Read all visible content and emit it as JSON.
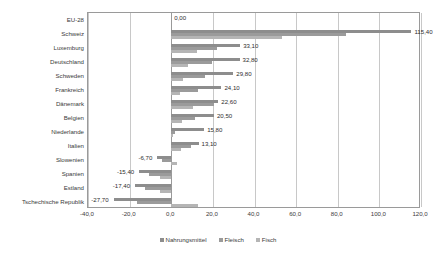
{
  "chart_data": {
    "type": "bar",
    "orientation": "horizontal",
    "title": "",
    "xlabel": "",
    "ylabel": "",
    "xlim": [
      -40.0,
      120.0
    ],
    "xticks": [
      "-40,0",
      "-20,0",
      "0,0",
      "20,0",
      "40,0",
      "60,0",
      "80,0",
      "100,0",
      "120,0"
    ],
    "xtick_values": [
      -40.0,
      -20.0,
      0.0,
      20.0,
      40.0,
      60.0,
      80.0,
      100.0,
      120.0
    ],
    "grid": true,
    "legend_position": "bottom",
    "categories": [
      "EU-28",
      "Schweiz",
      "Luxemburg",
      "Deutschland",
      "Schweden",
      "Frankreich",
      "Dänemark",
      "Belgien",
      "Niederlande",
      "Italien",
      "Slowenien",
      "Spanien",
      "Estland",
      "Tschechische Republik"
    ],
    "series": [
      {
        "name": "Nahrungsmittel",
        "color": "#8d8d8d",
        "values": [
          0.0,
          115.4,
          33.1,
          32.8,
          29.8,
          24.1,
          22.6,
          20.5,
          15.8,
          13.1,
          -6.7,
          -15.4,
          -17.4,
          -27.7
        ]
      },
      {
        "name": "Fleisch",
        "color": "#9b9b9b",
        "values": [
          0.0,
          84.0,
          22.0,
          19.5,
          16.0,
          13.0,
          20.5,
          11.5,
          2.0,
          9.5,
          -4.5,
          -10.5,
          -12.5,
          -16.5
        ]
      },
      {
        "name": "Fisch",
        "color": "#b5b5b5",
        "values": [
          0.0,
          53.0,
          12.5,
          8.0,
          5.5,
          4.0,
          10.5,
          5.0,
          1.0,
          4.5,
          3.0,
          -5.5,
          -5.5,
          13.0
        ]
      }
    ],
    "data_labels": [
      "0,00",
      "115,40",
      "33,10",
      "32,80",
      "29,80",
      "24,10",
      "22,60",
      "20,50",
      "15,80",
      "13,10",
      "-6,70",
      "-15,40",
      "-17,40",
      "-27,70"
    ]
  },
  "legend": {
    "items": [
      {
        "label": "Nahrungsmittel",
        "color": "#8d8d8d"
      },
      {
        "label": "Fleisch",
        "color": "#9b9b9b"
      },
      {
        "label": "Fisch",
        "color": "#b5b5b5"
      }
    ]
  }
}
